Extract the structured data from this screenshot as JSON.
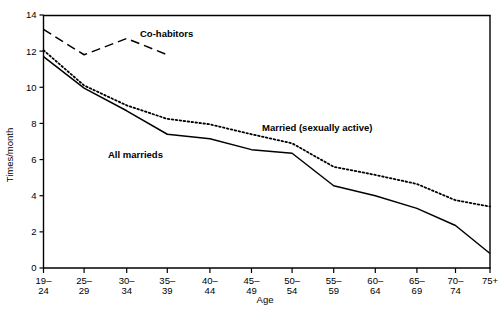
{
  "chart_data": {
    "type": "line",
    "title": "",
    "xlabel": "Age",
    "ylabel": "Times/month",
    "categories": [
      "19-24",
      "25-29",
      "30-34",
      "35-39",
      "40-44",
      "45-49",
      "50-54",
      "55-59",
      "60-64",
      "65-69",
      "70-74",
      "75+"
    ],
    "category_lines": [
      [
        "19–",
        "24"
      ],
      [
        "25–",
        "29"
      ],
      [
        "30–",
        "34"
      ],
      [
        "35–",
        "39"
      ],
      [
        "40–",
        "44"
      ],
      [
        "45–",
        "49"
      ],
      [
        "50–",
        "54"
      ],
      [
        "55–",
        "59"
      ],
      [
        "60–",
        "64"
      ],
      [
        "65–",
        "69"
      ],
      [
        "70–",
        "74"
      ],
      [
        "75+",
        ""
      ]
    ],
    "ylim": [
      0,
      14
    ],
    "yticks": [
      0,
      2,
      4,
      6,
      8,
      10,
      12,
      14
    ],
    "ytick_labels": [
      "0",
      "2",
      "4",
      "6",
      "8",
      "10",
      "12",
      "14"
    ],
    "grid": false,
    "legend_position": "inline-annotations",
    "series": [
      {
        "name": "Co-habitors",
        "style": "dashed",
        "color": "#000000",
        "values": [
          13.2,
          11.8,
          12.7,
          11.8,
          null,
          null,
          null,
          null,
          null,
          null,
          null,
          null
        ],
        "label": "Co-habitors",
        "label_x": 140,
        "label_y": 37
      },
      {
        "name": "Married (sexually active)",
        "style": "dotted",
        "color": "#000000",
        "values": [
          12.05,
          10.1,
          9.0,
          8.25,
          7.95,
          7.4,
          6.9,
          5.6,
          5.15,
          4.65,
          3.75,
          3.4
        ],
        "label": "Married (sexually active)",
        "label_x": 262,
        "label_y": 131
      },
      {
        "name": "All marrieds",
        "style": "solid",
        "color": "#000000",
        "values": [
          11.7,
          9.95,
          8.7,
          7.4,
          7.15,
          6.55,
          6.35,
          4.55,
          4.0,
          3.3,
          2.35,
          0.8
        ],
        "label": "All marrieds",
        "label_x": 108,
        "label_y": 158
      }
    ]
  },
  "axes": {
    "x_axis_label": "Age",
    "y_axis_label": "Times/month"
  }
}
